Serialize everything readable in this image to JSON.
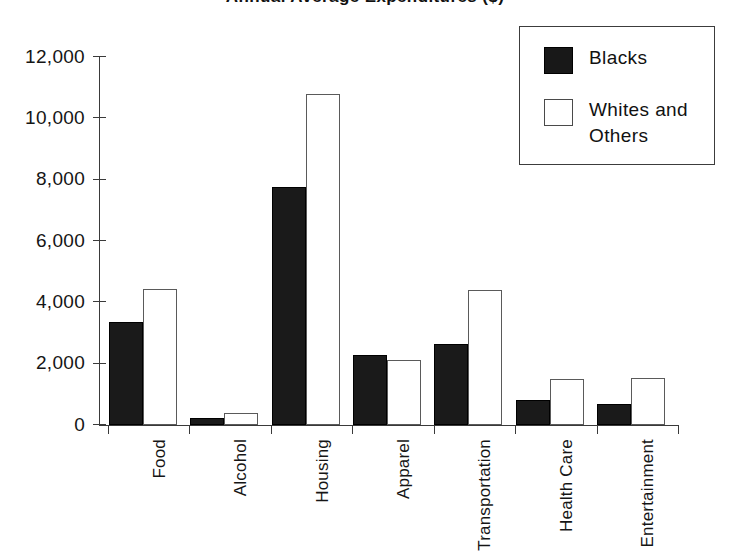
{
  "chart_data": {
    "type": "bar",
    "title": "Annual Average Expenditures ($)",
    "xlabel": "",
    "ylabel": "",
    "ylim": [
      0,
      12000
    ],
    "ytick_labels": [
      "0",
      "2,000",
      "4,000",
      "6,000",
      "8,000",
      "10,000",
      "12,000"
    ],
    "ytick_values": [
      0,
      2000,
      4000,
      6000,
      8000,
      10000,
      12000
    ],
    "grid": false,
    "legend_position": "top-right",
    "categories": [
      "Food",
      "Alcohol",
      "Housing",
      "Apparel",
      "Transportation",
      "Health Care",
      "Entertainment"
    ],
    "series": [
      {
        "name": "Blacks",
        "color": "#1a1a1a",
        "values": [
          3350,
          220,
          7750,
          2280,
          2650,
          820,
          680
        ]
      },
      {
        "name": "Whites and Others",
        "color": "#ffffff",
        "values": [
          4450,
          400,
          10800,
          2130,
          4400,
          1500,
          1530
        ]
      }
    ]
  },
  "legend": {
    "entries": [
      {
        "label": "Blacks",
        "swatch": "filled-black-square"
      },
      {
        "label": "Whites and Others",
        "swatch": "empty-white-square"
      }
    ]
  },
  "colors": {
    "axis": "#3a3a3a",
    "text": "#151515",
    "series_black": "#1a1a1a",
    "series_white": "#ffffff",
    "background": "#ffffff"
  }
}
